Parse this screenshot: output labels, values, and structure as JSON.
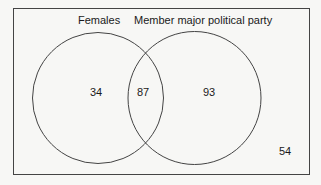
{
  "diagram": {
    "type": "venn",
    "sets": [
      {
        "label": "Females",
        "only_count": "34"
      },
      {
        "label": "Member major political party",
        "only_count": "93"
      }
    ],
    "intersection_count": "87",
    "outside_count": "54"
  }
}
